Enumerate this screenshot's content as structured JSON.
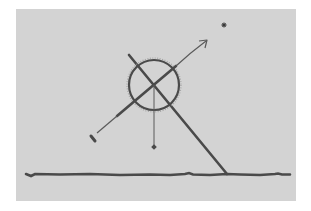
{
  "figure": {
    "description": "Sketch of a sighting instrument: a ringed sighting tube aimed at a star, with a plumb line and a support pole resting on the ground",
    "colors": {
      "background": "#ffffff",
      "panel": "#d3d3d3",
      "ink": "#4a4a4a",
      "ink_light": "#6a6a6a"
    },
    "elements": {
      "star": {
        "label": "star",
        "x": 224,
        "y": 25
      },
      "ring": {
        "label": "sighting ring",
        "cx": 154,
        "cy": 85,
        "r": 25
      },
      "sight_line": {
        "label": "line of sight",
        "x1": 92,
        "y1": 137,
        "x2": 207,
        "y2": 40
      },
      "support_pole": {
        "label": "support pole",
        "x1": 129,
        "y1": 55,
        "x2": 227,
        "y2": 174
      },
      "plumb_line": {
        "label": "plumb line",
        "x": 154,
        "y1": 85,
        "y2": 147
      },
      "plumb_bob": {
        "label": "plumb bob",
        "x": 154,
        "y": 147
      },
      "ground": {
        "label": "ground",
        "x1": 26,
        "x2": 290,
        "y": 175
      }
    }
  }
}
